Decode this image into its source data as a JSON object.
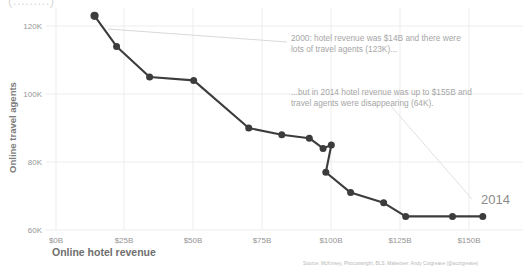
{
  "title_remnant": "(.........)",
  "axes": {
    "x_title": "Online hotel revenue",
    "y_title": "Online travel agents",
    "x_ticks": [
      "$0B",
      "$25B",
      "$50B",
      "$75B",
      "$100B",
      "$125B",
      "$150B"
    ],
    "y_ticks": [
      "120K",
      "100K",
      "80K",
      "60K"
    ]
  },
  "annotations": {
    "first": "2000: hotel revenue was  $14B and there were\nlots of travel agents (123K)...",
    "second": "...but in 2014 hotel revenue was up to $155B and\ntravel agents were disappearing (64K).",
    "end_year": "2014"
  },
  "source": "Source: McKinsey, Phocuswright, BLS. Makeover: Andy Cotgreave (@acotgreave)",
  "colors": {
    "line": "#3c3c3c",
    "marker": "#3c3c3c",
    "grid": "#ededed",
    "text": "#a6a6a6",
    "leader": "#d0d0d0"
  },
  "chart_data": {
    "type": "scatter",
    "title": "",
    "xlabel": "Online hotel revenue",
    "ylabel": "Online travel agents",
    "xlim": [
      0,
      170
    ],
    "ylim": [
      55000,
      128000
    ],
    "grid": true,
    "legend": "none",
    "x_unit": "billions USD",
    "y_unit": "travel agents",
    "connected": true,
    "labels": [
      "2000",
      "2001",
      "2002",
      "2003",
      "2004",
      "2005",
      "2006",
      "2007",
      "2008",
      "2009",
      "2010",
      "2011",
      "2012",
      "2013",
      "2014"
    ],
    "x": [
      14,
      22,
      34,
      50,
      70,
      82,
      92,
      97,
      100,
      98,
      107,
      119,
      127,
      144,
      155
    ],
    "y": [
      123000,
      114000,
      105000,
      104000,
      90000,
      88000,
      87000,
      84000,
      85000,
      77000,
      71000,
      68000,
      64000,
      64000,
      64000
    ],
    "annotations": [
      {
        "text": "2000: hotel revenue was  $14B and there were lots of travel agents (123K)...",
        "points_to": [
          14,
          123000
        ]
      },
      {
        "text": "...but in 2014 hotel revenue was up to $155B and travel agents were disappearing (64K).",
        "points_to": [
          155,
          64000
        ]
      },
      {
        "text": "2014",
        "points_to": [
          155,
          64000
        ]
      }
    ]
  }
}
